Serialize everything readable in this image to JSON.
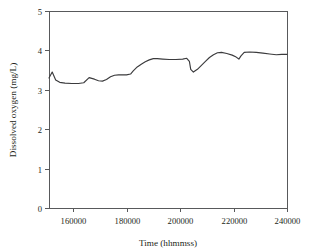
{
  "chart_data": {
    "type": "line",
    "title": "",
    "xlabel": "Time (hhmmss)",
    "ylabel": "Dissolved oxygen (mg/L)",
    "xlim": [
      151000,
      240000
    ],
    "ylim": [
      0,
      5
    ],
    "xticks": [
      160000,
      180000,
      200000,
      220000,
      240000
    ],
    "xtick_labels": [
      "160000",
      "180000",
      "200000",
      "220000",
      "240000"
    ],
    "yticks": [
      0,
      1,
      2,
      3,
      4,
      5
    ],
    "ytick_labels": [
      "0",
      "1",
      "2",
      "3",
      "4",
      "5"
    ],
    "grid": false,
    "legend": null,
    "line_color": "#3b3b3d",
    "axis_color": "#58595b",
    "series": [
      {
        "name": "Dissolved oxygen",
        "x": [
          151000,
          152200,
          153500,
          155000,
          157000,
          159500,
          162000,
          164000,
          166000,
          168000,
          169500,
          171000,
          172500,
          174000,
          175500,
          177000,
          178500,
          180000,
          181500,
          182500,
          184000,
          185500,
          187000,
          188500,
          190000,
          191500,
          193500,
          196000,
          198500,
          201000,
          202500,
          203500,
          204000,
          205000,
          206500,
          208000,
          209500,
          211000,
          212500,
          214000,
          215500,
          217500,
          219500,
          221000,
          222000,
          222800,
          224000,
          226000,
          228500,
          231000,
          233500,
          236000,
          238000,
          240000
        ],
        "y": [
          3.3,
          3.45,
          3.25,
          3.19,
          3.17,
          3.16,
          3.16,
          3.18,
          3.31,
          3.27,
          3.23,
          3.22,
          3.26,
          3.33,
          3.37,
          3.38,
          3.38,
          3.38,
          3.4,
          3.48,
          3.58,
          3.65,
          3.71,
          3.76,
          3.79,
          3.79,
          3.78,
          3.77,
          3.77,
          3.78,
          3.8,
          3.72,
          3.52,
          3.45,
          3.52,
          3.62,
          3.72,
          3.82,
          3.89,
          3.94,
          3.95,
          3.92,
          3.88,
          3.83,
          3.78,
          3.86,
          3.95,
          3.96,
          3.95,
          3.93,
          3.91,
          3.89,
          3.9,
          3.9
        ]
      }
    ]
  },
  "plot": {
    "frame": {
      "left": 49,
      "right": 287,
      "top": 11,
      "bottom": 208
    }
  }
}
